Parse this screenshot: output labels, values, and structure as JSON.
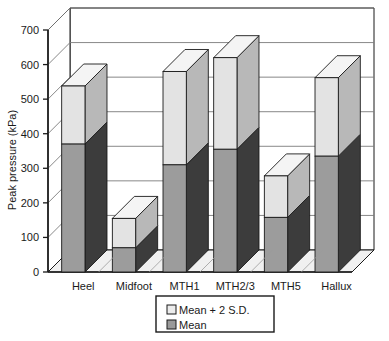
{
  "chart_data": {
    "type": "bar",
    "subtype": "stacked-3d-column",
    "title": "",
    "xlabel": "",
    "ylabel": "Peak pressure (kPa)",
    "ylim": [
      0,
      700
    ],
    "ytick_step": 100,
    "yticks": [
      "0",
      "100",
      "200",
      "300",
      "400",
      "500",
      "600",
      "700"
    ],
    "grid": true,
    "grid_axis": "y",
    "legend_position": "bottom",
    "categories": [
      "Heel",
      "Midfoot",
      "MTH1",
      "MTH2/3",
      "MTH5",
      "Hallux"
    ],
    "series": [
      {
        "name": "Mean",
        "color": "#9a9a9a",
        "values": [
          370,
          70,
          310,
          355,
          158,
          335
        ]
      },
      {
        "name": "Mean + 2 S.D.",
        "color": "#e0e0e0",
        "values": [
          538,
          155,
          580,
          620,
          278,
          562
        ]
      }
    ],
    "legend": [
      {
        "label": "Mean + 2 S.D.",
        "swatch": "#ececec"
      },
      {
        "label": "Mean",
        "swatch": "#9a9a9a"
      }
    ]
  },
  "colors": {
    "bar_front_upper": "#e3e3e3",
    "bar_front_lower": "#9c9c9c",
    "bar_side_upper": "#b8b8b8",
    "bar_side_lower": "#3c3c3c",
    "bar_top": "#f4f4f4",
    "floor": "#f0f0f0",
    "wall": "#ffffff",
    "outline": "#1a1a1a",
    "gridline": "#7a7a7a",
    "text": "#1a1a1a"
  }
}
